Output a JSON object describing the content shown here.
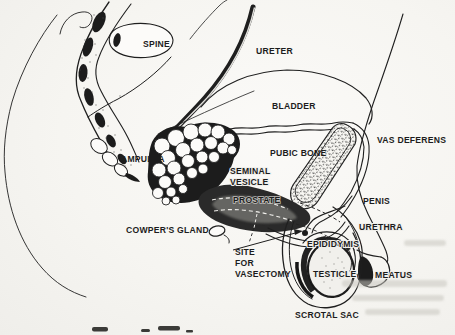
{
  "labels": {
    "spine": "SPINE",
    "ureter": "URETER",
    "bladder": "BLADDER",
    "vas_deferens": "VAS DEFERENS",
    "pubic_bone": "PUBIC BONE",
    "ampulla": "AMPULLA",
    "seminal_line1": "SEMINAL",
    "seminal_line2": "VESICLE",
    "prostate": "PROSTATE",
    "penis": "PENIS",
    "cowpers_gland": "COWPER'S GLAND",
    "urethra": "URETHRA",
    "epididymis": "EPIDIDYMIS",
    "site_line1": "SITE",
    "site_line2": "FOR",
    "site_line3": "VASECTOMY",
    "testicle": "TESTICLE",
    "meatus": "MEATUS",
    "scrotal_sac": "SCROTAL SAC"
  },
  "colors": {
    "ink": "#1f1f1f",
    "paper": "#f6f5f1"
  }
}
